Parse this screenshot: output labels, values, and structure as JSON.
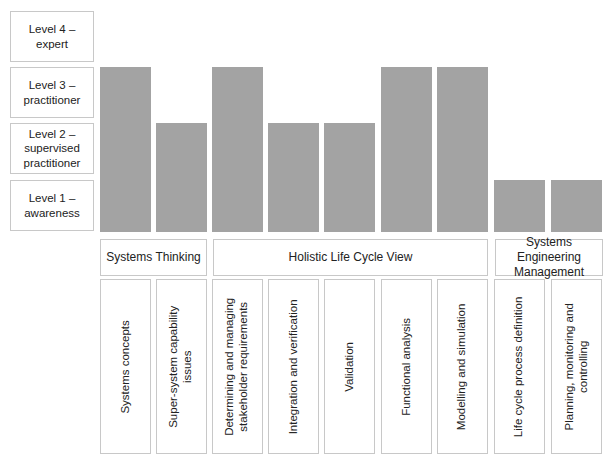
{
  "chart_data": {
    "type": "bar",
    "title": "",
    "xlabel": "",
    "ylabel": "",
    "ylim": [
      0,
      4
    ],
    "levels": [
      {
        "value": 4,
        "label_line1": "Level 4 –",
        "label_line2": "expert",
        "label_line3": ""
      },
      {
        "value": 3,
        "label_line1": "Level 3 –",
        "label_line2": "practitioner",
        "label_line3": ""
      },
      {
        "value": 2,
        "label_line1": "Level 2 –",
        "label_line2": "supervised",
        "label_line3": "practitioner"
      },
      {
        "value": 1,
        "label_line1": "Level 1 –",
        "label_line2": "awareness",
        "label_line3": ""
      }
    ],
    "groups": [
      {
        "name": "Systems Thinking",
        "line1": "Systems Thinking",
        "line2": "",
        "span": [
          0,
          1
        ]
      },
      {
        "name": "Holistic Life Cycle View",
        "line1": "Holistic Life Cycle View",
        "line2": "",
        "span": [
          2,
          6
        ]
      },
      {
        "name": "Systems Engineering Management",
        "line1": "Systems Engineering",
        "line2": "Management",
        "span": [
          7,
          8
        ]
      }
    ],
    "categories": [
      "Systems concepts",
      "Super-system capability issues",
      "Determining and managing stakeholder requirements",
      "Integration and verification",
      "Validation",
      "Functional analysis",
      "Modelling and simulation",
      "Life cycle process definition",
      "Planning, monitoring and controlling"
    ],
    "category_lines": [
      [
        "Systems concepts",
        ""
      ],
      [
        "Super-system capability",
        "issues"
      ],
      [
        "Determining and managing",
        "stakeholder requirements"
      ],
      [
        "Integration and verification",
        ""
      ],
      [
        "Validation",
        ""
      ],
      [
        "Functional analysis",
        ""
      ],
      [
        "Modelling and simulation",
        ""
      ],
      [
        "Life cycle process definition",
        ""
      ],
      [
        "Planning, monitoring and",
        "controlling"
      ]
    ],
    "values": [
      3,
      2,
      3,
      2,
      2,
      3,
      3,
      1,
      1
    ],
    "bar_color": "#a3a3a3",
    "grid": false,
    "legend": "none"
  }
}
